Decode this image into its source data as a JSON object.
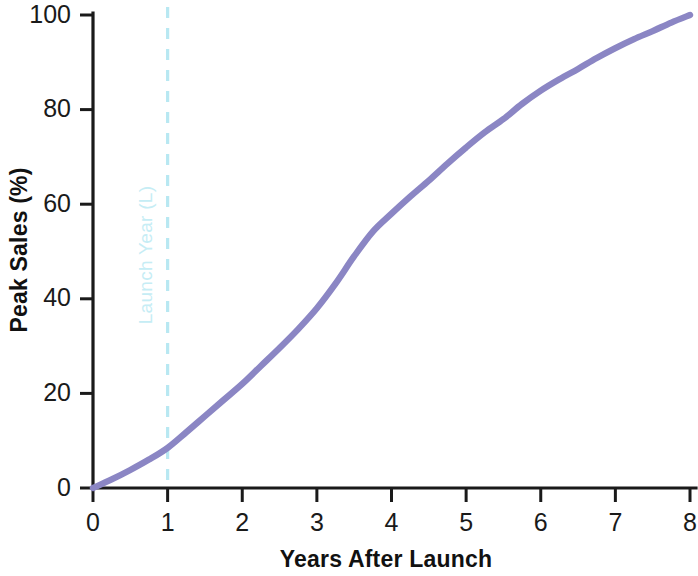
{
  "chart_data": {
    "type": "line",
    "title": "",
    "xlabel": "Years After Launch",
    "ylabel": "Peak Sales (%)",
    "xlim": [
      0,
      8
    ],
    "ylim": [
      0,
      100
    ],
    "grid": false,
    "legend": "none",
    "x": [
      0,
      1,
      2,
      3,
      4,
      5,
      6,
      7,
      8
    ],
    "xticks": [
      "0",
      "1",
      "2",
      "3",
      "4",
      "5",
      "6",
      "7",
      "8"
    ],
    "yticks": [
      "0",
      "20",
      "40",
      "60",
      "80",
      "100"
    ],
    "series": [
      {
        "name": "Peak Sales Uptake",
        "color": "#8b86c4",
        "values": [
          0,
          8.5,
          22,
          38,
          58,
          72,
          84,
          93,
          100
        ]
      }
    ],
    "dense_x": [
      0,
      0.25,
      0.5,
      0.75,
      1,
      1.25,
      1.5,
      1.75,
      2,
      2.25,
      2.5,
      2.75,
      3,
      3.25,
      3.5,
      3.75,
      4,
      4.25,
      4.5,
      4.75,
      5,
      5.25,
      5.5,
      5.75,
      6,
      6.25,
      6.5,
      6.75,
      7,
      7.25,
      7.5,
      7.75,
      8
    ],
    "dense_y": [
      0,
      1.8,
      3.8,
      6.0,
      8.5,
      11.8,
      15.2,
      18.6,
      22,
      25.8,
      29.6,
      33.6,
      38,
      43.2,
      49.0,
      54.2,
      58,
      61.6,
      65.0,
      68.6,
      72,
      75.2,
      78.0,
      81.2,
      84,
      86.4,
      88.6,
      90.9,
      93,
      94.9,
      96.6,
      98.4,
      100
    ],
    "annotations": [
      {
        "name": "launch-year-marker",
        "label": "Launch Year (L)",
        "x": 1,
        "orientation": "vertical",
        "style": "dashed",
        "color": "#b8e8f2",
        "label_color": "#c6edf5"
      }
    ],
    "colors": {
      "curve": "#8b86c4",
      "axis": "#1a1a1a",
      "text": "#1a1a1a",
      "marker": "#b8e8f2",
      "background": "#ffffff"
    }
  }
}
